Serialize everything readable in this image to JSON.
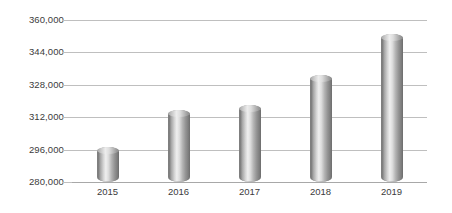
{
  "chart_data": {
    "type": "bar",
    "title": "",
    "subtitle": "",
    "xlabel": "",
    "ylabel": "",
    "categories": [
      "2015",
      "2016",
      "2017",
      "2018",
      "2019"
    ],
    "values": [
      297500,
      315700,
      318200,
      333000,
      353300
    ],
    "series": [
      {
        "name": "",
        "values": [
          297500,
          315700,
          318200,
          333000,
          353300
        ]
      }
    ],
    "ylim": [
      280000,
      360000
    ],
    "yticks": [
      280000,
      296000,
      312000,
      328000,
      344000,
      360000
    ],
    "ytick_labels": [
      "280,000",
      "296,000",
      "312,000",
      "328,000",
      "344,000",
      "360,000"
    ],
    "xtick_labels": [
      "2015",
      "2016",
      "2017",
      "2018",
      "2019"
    ],
    "grid": true,
    "grid_axis": "y",
    "legend": false,
    "legend_position": "none",
    "annotations": [],
    "bar_style": "cylinder-gradient-grey",
    "colors": {
      "bar_light": "#efefef",
      "bar_mid": "#b4b4b4",
      "bar_dark": "#6f6f6f",
      "gridline": "#bfbfbf",
      "axis": "#a8a8a8",
      "tick_text": "#3b3b3b",
      "background": "#ffffff"
    }
  }
}
